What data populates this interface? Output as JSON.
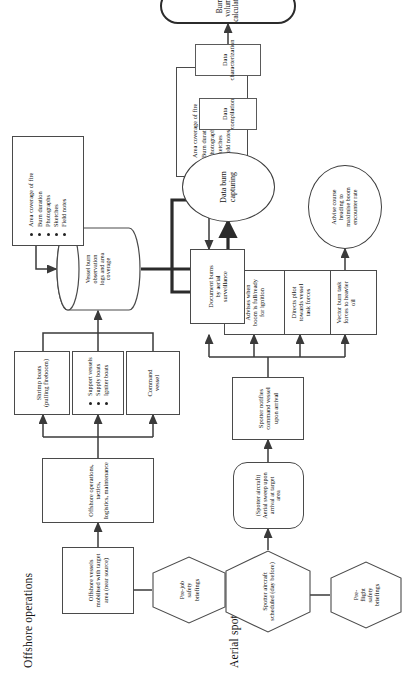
{
  "figure": {
    "type": "flowchart",
    "orientation": "rotated-90-ccw",
    "sections": [
      {
        "id": "offshore",
        "title": "Offshore operations"
      },
      {
        "id": "aerial",
        "title": "Aerial spotting"
      }
    ]
  },
  "offshore": {
    "title": "Offshore operations",
    "prejob_briefing": "Pre-job\nsafety\nbriefings",
    "mobilised": "Offshore vessels\nmobilised with target\narea (near source)",
    "ops_tactics": "Offshore operations, tactics,\nlogistics, maintenance",
    "command_vessel": "Command\nvessel",
    "support_vessels_title": "Support vessels",
    "support_vessels": [
      "Support vessels",
      "Supply boats",
      "Igniter boats"
    ],
    "shrimp_boats": "Shrimp boats\n(pulling fireboom)",
    "vessel_logs": "Vessel burn\nobservation\nlogs and area\ncoverage",
    "observation_items": [
      "Area coverage of fire",
      "Burn duration",
      "Photographs",
      "Sketches",
      "Field notes"
    ]
  },
  "aerial": {
    "title": "Aerial spotting",
    "preflight_briefing": "Pre-\nflight\nsafety\nbriefings",
    "aircraft_scheduled": "Spotter aircraft\nscheduled (day before)",
    "aerial_sweep": "(Spotter aircraft)\nAerial sweep upon\narrival at target\narea",
    "spotter_notifies": "Spotter notifies\ncommand vessel\nupon arrival",
    "vector_burn": "Vector burn task\nforces to heavier\noil",
    "advise_course": "Advise course\nheading to\nmaximise boom\nencounter rate",
    "directs_pilot": "Directs pilot\ntowards vessel\ntask forces",
    "advises_boom": "Advises when\nboom is full/ready\nfor ignition",
    "document_burns": "Document burns\nby aerial\nsurveillance",
    "surveillance_items": [
      "Area coverage of fire",
      "Burn duration",
      "Photographs",
      "Sketches",
      "Field notes"
    ]
  },
  "processing": {
    "data_burn_capturing": "Data burn\ncapturing",
    "data_compilation": "Data\ncompilation",
    "data_characterization": "Data\ncharacterization",
    "burn_volume": "Burn volume calculation"
  },
  "colors": {
    "stroke": "#3a3a3a",
    "stroke_bold": "#2b2b2b",
    "background": "#ffffff",
    "text": "#111111"
  }
}
